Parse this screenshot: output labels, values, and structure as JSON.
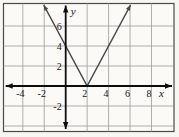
{
  "chart_data": {
    "type": "line",
    "title": "",
    "xlabel": "x",
    "ylabel": "y",
    "xlim": [
      -5.8,
      10.1
    ],
    "ylim": [
      -4.55,
      8.25
    ],
    "grid": true,
    "grid_spacing": 2,
    "x_gridlines": [
      -4,
      -2,
      2,
      4,
      6,
      8
    ],
    "y_gridlines": [
      -4,
      -2,
      2,
      4,
      6
    ],
    "x_ticks": [
      -4,
      -2,
      2,
      4,
      6,
      8
    ],
    "y_ticks": [
      6,
      4,
      2,
      -2
    ],
    "axis_arrows": "all-four-ends",
    "series": [
      {
        "name": "absolute-value-v-graph",
        "vertex": [
          2,
          0
        ],
        "slope_left": -2,
        "slope_right": 2,
        "y_intercept": [
          0,
          4
        ],
        "points": [
          [
            -2.05,
            8.1
          ],
          [
            2,
            0
          ],
          [
            6.05,
            8.1
          ]
        ],
        "arrows": "both-ends",
        "color": "#474747"
      }
    ]
  },
  "colors": {
    "page_background": "#f7f6f1",
    "plot_background": "#fbfaf6",
    "border": "#4a4a4a",
    "grid": "#9c9c9c",
    "axis": "#0d0d0d",
    "line": "#474747",
    "text": "#141414"
  }
}
